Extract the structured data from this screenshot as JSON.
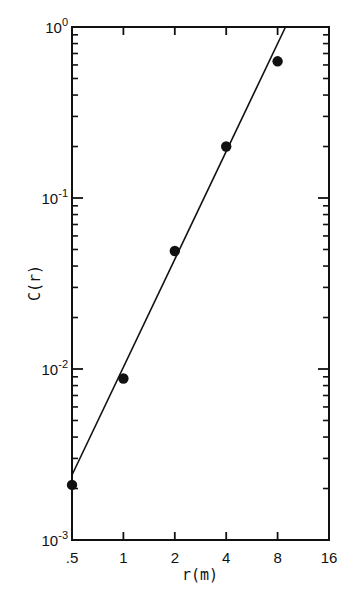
{
  "chart_data": {
    "type": "scatter",
    "title": "",
    "xlabel": "r(m)",
    "ylabel": "C(r)",
    "xscale": "log2",
    "yscale": "log10",
    "xlim": [
      0.5,
      16
    ],
    "ylim": [
      0.001,
      1
    ],
    "x_ticks": [
      ".5",
      "1",
      "2",
      "4",
      "8",
      "16"
    ],
    "x_tick_values": [
      0.5,
      1,
      2,
      4,
      8,
      16
    ],
    "y_ticks": [
      {
        "base": "10",
        "exp": "0",
        "value": 1
      },
      {
        "base": "10",
        "exp": "-1",
        "value": 0.1
      },
      {
        "base": "10",
        "exp": "-2",
        "value": 0.01
      },
      {
        "base": "10",
        "exp": "-3",
        "value": 0.001
      }
    ],
    "grid": false,
    "legend": null,
    "series": [
      {
        "name": "measured",
        "kind": "points",
        "x": [
          0.5,
          1,
          2,
          4,
          8
        ],
        "y": [
          0.0021,
          0.0088,
          0.049,
          0.2,
          0.63
        ]
      },
      {
        "name": "fit",
        "kind": "line",
        "x": [
          0.5,
          8.9
        ],
        "y": [
          0.0024,
          1.0
        ]
      }
    ]
  }
}
